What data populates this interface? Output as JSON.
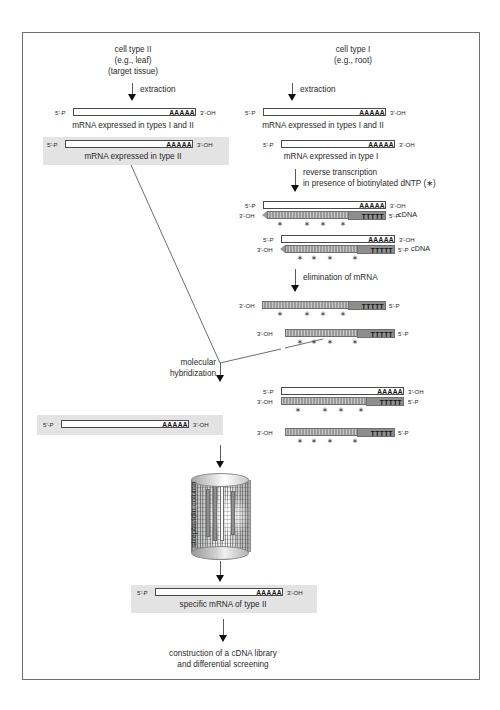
{
  "figure": {
    "border_color": "#6f6f6f",
    "highlight_color": "#e3e3e3",
    "cdna_color": "#9a9a9a"
  },
  "columns": {
    "left": {
      "heading_line1": "cell type II",
      "heading_line2": "(e.g., leaf)",
      "heading_line3": "(target tissue)",
      "step_extraction": "extraction",
      "strand1_caption": "mRNA expressed in types I and II",
      "strand2_caption": "mRNA expressed in type II"
    },
    "right": {
      "heading_line1": "cell type I",
      "heading_line2": "(e.g., root)",
      "step_extraction": "extraction",
      "strand1_caption": "mRNA expressed in types I and II",
      "strand2_caption": "mRNA expressed in type I",
      "step_rt_line1": "reverse transcription",
      "step_rt_line2": "in presence of biotinylated dNTP (∗)",
      "step_elimination": "elimination of mRNA",
      "cdna_label": "cDNA"
    }
  },
  "middle": {
    "hybridization_line1": "molecular",
    "hybridization_line2": "hybridization",
    "column_label": "streptavidin column",
    "final_caption": "specific mRNA of type II",
    "final_step_line1": "construction of a cDNA library",
    "final_step_line2": "and  differential screening"
  },
  "ends": {
    "five_prime_p": "5'-P",
    "three_prime_oh": "3'-OH",
    "polyA": "AAAAA",
    "polyT": "TTTTT"
  },
  "marks": {
    "biotin_star": "∗"
  }
}
